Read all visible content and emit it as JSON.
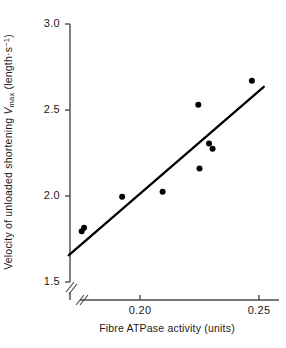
{
  "chart_data": {
    "type": "scatter",
    "title": "",
    "xlabel": "Fibre ATPase activity (units)",
    "ylabel_parts": {
      "pre": "Velocity of unloaded shortening ",
      "symbol": "V",
      "symbol_sub": "max",
      "units_open": " (length",
      "units_dot": "·",
      "units_s": "s",
      "units_exp": "−1",
      "units_close": ")"
    },
    "ylabel": "Velocity of unloaded shortening Vmax (length·s−1)",
    "xticks": [
      "0.20",
      "0.25"
    ],
    "xtick_values": [
      0.2,
      0.25
    ],
    "yticks": [
      "1.5",
      "2.0",
      "2.5",
      "3.0"
    ],
    "ytick_values": [
      1.5,
      2.0,
      2.5,
      3.0
    ],
    "xlim": [
      0.1685,
      0.2585
    ],
    "ylim": [
      1.5,
      3.0
    ],
    "y_axis_break": true,
    "x_axis_break": true,
    "grid": false,
    "legend": null,
    "marker": {
      "shape": "filled-circle",
      "color": "#000000",
      "size_px": 6
    },
    "points": [
      {
        "x": 0.1755,
        "y": 1.795
      },
      {
        "x": 0.1765,
        "y": 1.815
      },
      {
        "x": 0.1925,
        "y": 1.995
      },
      {
        "x": 0.2095,
        "y": 2.025
      },
      {
        "x": 0.2245,
        "y": 2.53
      },
      {
        "x": 0.225,
        "y": 2.16
      },
      {
        "x": 0.229,
        "y": 2.305
      },
      {
        "x": 0.2305,
        "y": 2.275
      },
      {
        "x": 0.247,
        "y": 2.67
      }
    ],
    "fit_line": {
      "type": "linear-regression",
      "color": "#000000",
      "width_px": 2.3,
      "x_start": 0.17,
      "y_start": 1.655,
      "x_end": 0.252,
      "y_end": 2.635
    },
    "colors": {
      "axis": "#4a4a4a",
      "marker": "#000000",
      "line": "#000000",
      "text": "#1a1a1a",
      "background": "#ffffff"
    }
  },
  "axis_geometry": {
    "x_pixel_at_0_20": 140,
    "x_pixel_at_0_25": 259,
    "y_pixel_at_1_5": 282,
    "y_pixel_at_3_0": 24,
    "axis_x": 70,
    "axis_y": 300
  }
}
